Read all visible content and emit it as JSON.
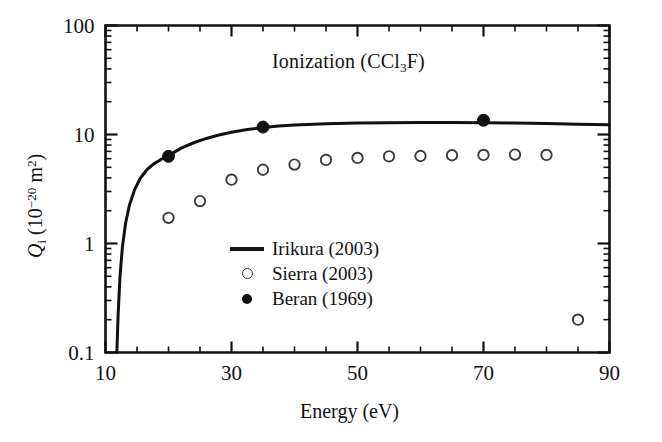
{
  "chart_data": {
    "type": "scatter",
    "title": "Ionization (CCl3F)",
    "title_html": "Ionization (CCl<sub>3</sub>F)",
    "xlabel": "Energy (eV)",
    "ylabel": "Qi (10-20 m2)",
    "ylabel_html": "<i>Q</i><sub>i</sub> (10<sup>−20</sup> m<sup>2</sup>)",
    "xlim": [
      10,
      90
    ],
    "ylim": [
      0.1,
      100
    ],
    "xscale": "linear",
    "yscale": "log",
    "grid": false,
    "legend_position": "lower-center-left",
    "x_major_ticks": [
      10,
      30,
      50,
      70,
      90
    ],
    "x_major_tick_labels": [
      "10",
      "30",
      "50",
      "70",
      "90"
    ],
    "x_minor_tick_step": 5,
    "y_major_ticks": [
      0.1,
      1,
      10,
      100
    ],
    "y_major_tick_labels": [
      "0.1",
      "1",
      "10",
      "100"
    ],
    "series": [
      {
        "name": "Irikura (2003)",
        "marker": "line",
        "x": [
          11.8,
          12.0,
          12.3,
          12.7,
          13.2,
          13.8,
          14.6,
          15.5,
          16.5,
          17.6,
          18.8,
          20.0,
          22.0,
          24.0,
          26.0,
          28.0,
          30.0,
          32.5,
          35.0,
          37.5,
          40.0,
          45.0,
          50.0,
          55.0,
          60.0,
          65.0,
          70.0,
          75.0,
          80.0,
          85.0,
          90.0
        ],
        "y": [
          0.1,
          0.22,
          0.5,
          0.95,
          1.55,
          2.25,
          3.1,
          3.95,
          4.7,
          5.35,
          5.9,
          6.4,
          7.5,
          8.4,
          9.2,
          9.9,
          10.5,
          11.1,
          11.6,
          11.95,
          12.2,
          12.55,
          12.75,
          12.85,
          12.9,
          12.9,
          12.85,
          12.75,
          12.6,
          12.45,
          12.3
        ]
      },
      {
        "name": "Sierra (2003)",
        "marker": "open-circle",
        "x": [
          20,
          25,
          30,
          35,
          40,
          45,
          50,
          55,
          60,
          65,
          70,
          75,
          80,
          85
        ],
        "y": [
          1.72,
          2.45,
          3.85,
          4.75,
          5.3,
          5.85,
          6.1,
          6.3,
          6.35,
          6.45,
          6.5,
          6.55,
          6.5,
          0.2
        ]
      },
      {
        "name": "Beran (1969)",
        "marker": "filled-circle",
        "x": [
          20,
          35,
          70
        ],
        "y": [
          6.3,
          11.7,
          13.5
        ]
      }
    ]
  },
  "legend": {
    "items": [
      {
        "label": "Irikura (2003)",
        "key": "line"
      },
      {
        "label": "Sierra (2003)",
        "key": "open-circle"
      },
      {
        "label": "Beran (1969)",
        "key": "filled-circle"
      }
    ]
  },
  "colors": {
    "ink": "#111111",
    "marker_stroke": "#3b3b3b",
    "background": "#ffffff"
  }
}
